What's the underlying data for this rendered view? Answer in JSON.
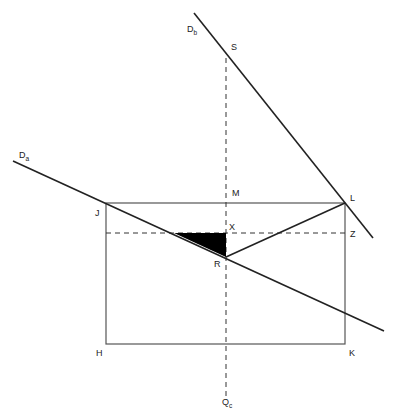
{
  "diagram": {
    "labels": {
      "Db": {
        "main": "D",
        "sub": "b"
      },
      "Da": {
        "main": "D",
        "sub": "a"
      },
      "Qc": {
        "main": "Q",
        "sub": "c"
      },
      "S": "S",
      "M": "M",
      "L": "L",
      "J": "J",
      "X": "X",
      "Z": "Z",
      "R": "R",
      "H": "H",
      "K": "K"
    },
    "colors": {
      "line": "#222222",
      "rect": "#555555",
      "fill": "#000000"
    }
  }
}
